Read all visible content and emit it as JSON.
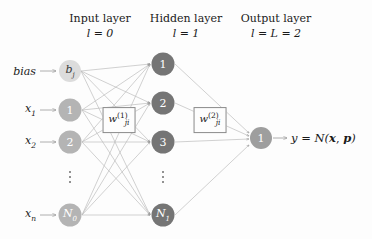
{
  "diagram": {
    "colors": {
      "background": "#fdfdfd",
      "bias_node": "#dcdcdc",
      "input_node": "#b4b4b4",
      "hidden_node": "#757575",
      "output_node": "#9e9e9e",
      "edge": "#b9b9b9",
      "arrow": "#8f8f8f",
      "text": "#1a1a1a",
      "box_border": "#8a8a8a"
    },
    "headers": [
      {
        "name": "input-layer",
        "title": "Input layer",
        "formula": "l = 0",
        "cx": 100
      },
      {
        "name": "hidden-layer",
        "title": "Hidden layer",
        "formula": "l = 1",
        "cx": 186
      },
      {
        "name": "output-layer",
        "title": "Output layer",
        "formula": "l = L = 2",
        "cx": 276
      }
    ],
    "input_labels": [
      {
        "name": "bias-label",
        "text": "bias",
        "sub": "",
        "cy": 71
      },
      {
        "name": "x1-label",
        "text": "x",
        "sub": "1",
        "cy": 110
      },
      {
        "name": "x2-label",
        "text": "x",
        "sub": "2",
        "cy": 142
      },
      {
        "name": "xn-label",
        "text": "x",
        "sub": "n",
        "cy": 215
      }
    ],
    "input_nodes": [
      {
        "name": "bias-node",
        "label": "b",
        "sub": "j",
        "italic": true,
        "shade": "bias",
        "cx": 70,
        "cy": 71,
        "r": 11
      },
      {
        "name": "input-node-1",
        "label": "1",
        "sub": "",
        "italic": false,
        "shade": "input",
        "cx": 70,
        "cy": 110,
        "r": 11.5
      },
      {
        "name": "input-node-2",
        "label": "2",
        "sub": "",
        "italic": false,
        "shade": "input",
        "cx": 70,
        "cy": 142,
        "r": 11.5
      },
      {
        "name": "input-node-n0",
        "label": "N",
        "sub": "0",
        "italic": true,
        "shade": "input",
        "cx": 70,
        "cy": 215,
        "r": 11.5
      }
    ],
    "hidden_nodes": [
      {
        "name": "hidden-node-1",
        "label": "1",
        "sub": "",
        "italic": false,
        "cx": 163,
        "cy": 64,
        "r": 11.5
      },
      {
        "name": "hidden-node-2",
        "label": "2",
        "sub": "",
        "italic": false,
        "cx": 163,
        "cy": 103,
        "r": 11.5
      },
      {
        "name": "hidden-node-3",
        "label": "3",
        "sub": "",
        "italic": false,
        "cx": 163,
        "cy": 142,
        "r": 11.5
      },
      {
        "name": "hidden-node-n1",
        "label": "N",
        "sub": "1",
        "italic": true,
        "cx": 163,
        "cy": 215,
        "r": 11.5
      }
    ],
    "output_nodes": [
      {
        "name": "output-node-1",
        "label": "1",
        "sub": "",
        "italic": false,
        "cx": 261,
        "cy": 138,
        "r": 11
      }
    ],
    "ellipses": [
      {
        "name": "input-ellipsis",
        "cx": 70,
        "cy": 177
      },
      {
        "name": "hidden-ellipsis",
        "cx": 163,
        "cy": 177
      }
    ],
    "weight_boxes": [
      {
        "name": "weight-box-layer1",
        "w": "w",
        "sub": "ji",
        "sup": "(1)",
        "cx": 119,
        "cy": 120
      },
      {
        "name": "weight-box-layer2",
        "w": "w",
        "sub": "ji",
        "sup": "(2)",
        "cx": 210,
        "cy": 120
      }
    ],
    "output_equation": {
      "name": "output-equation",
      "y": "y",
      "equals": "=",
      "fn": "N(",
      "x": "x",
      "comma": ",",
      "p": "p",
      "close": ")",
      "x_px": 291,
      "cy": 138
    }
  }
}
